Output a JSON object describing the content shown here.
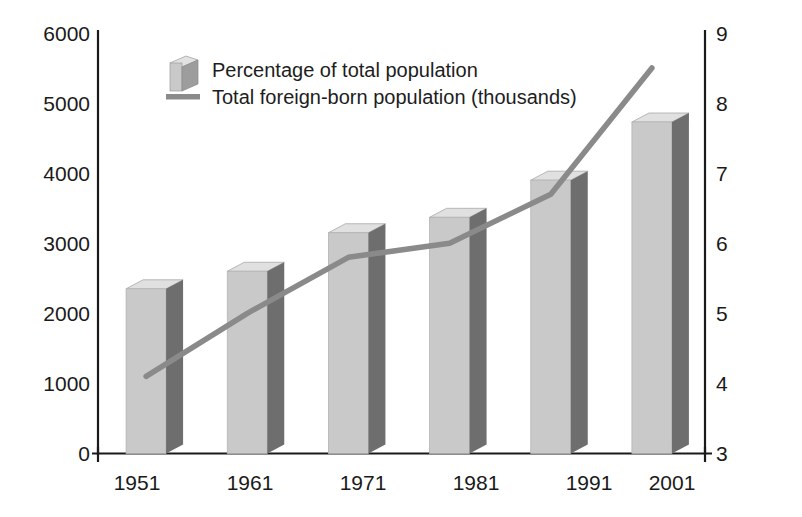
{
  "chart_data": {
    "type": "bar",
    "title": "",
    "subtitle": "",
    "xlabel": "",
    "ylabel": "",
    "grid": false,
    "legend_position": "top-center",
    "categories": [
      "1951",
      "1961",
      "1971",
      "1981",
      "1991",
      "2001"
    ],
    "left_axis": {
      "label": "Total foreign-born population (thousands)",
      "ticks": [
        "0",
        "1000",
        "2000",
        "3000",
        "4000",
        "5000",
        "6000"
      ],
      "tick_values": [
        0,
        1000,
        2000,
        3000,
        4000,
        5000,
        6000
      ],
      "ylim": [
        0,
        6000
      ]
    },
    "right_axis": {
      "label": "Percentage of total population",
      "ticks": [
        "3",
        "4",
        "5",
        "6",
        "7",
        "8",
        "9"
      ],
      "tick_values": [
        3,
        4,
        5,
        6,
        7,
        8,
        9
      ],
      "ylim": [
        3,
        9
      ]
    },
    "series": [
      {
        "name": "Total foreign-born population (thousands)",
        "type": "bar",
        "axis": "left",
        "values": [
          2350,
          2600,
          3150,
          3370,
          3900,
          4730
        ],
        "color_front": "#c9c9c9",
        "color_side": "#6e6e6e",
        "color_top": "#e0e0e0"
      },
      {
        "name": "Percentage of total population",
        "type": "line",
        "axis": "right",
        "values": [
          4.1,
          5.0,
          5.8,
          6.0,
          6.7,
          8.5
        ],
        "color": "#8a8a8a"
      }
    ]
  },
  "legend": {
    "items": [
      {
        "label": "Percentage of total population",
        "marker": "bar-3d-swatch"
      },
      {
        "label": "Total foreign-born population (thousands)",
        "marker": "line-swatch"
      }
    ]
  },
  "colors": {
    "axis": "#1a1a1a",
    "bar_front": "#c9c9c9",
    "bar_side": "#6e6e6e",
    "bar_top": "#e2e2e2",
    "line": "#8a8a8a",
    "background": "#ffffff",
    "text": "#1a1a1a"
  }
}
